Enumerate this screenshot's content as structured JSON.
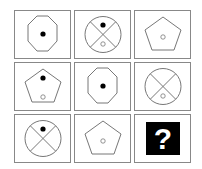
{
  "puzzle": {
    "type": "3x3 matrix reasoning",
    "cells": [
      {
        "row": 1,
        "col": 1,
        "shape": "octagon",
        "dots": [
          {
            "pos": "center",
            "fill": "black"
          }
        ]
      },
      {
        "row": 1,
        "col": 2,
        "shape": "circle-with-x",
        "dots": [
          {
            "pos": "top",
            "fill": "black"
          },
          {
            "pos": "bottom",
            "fill": "white"
          }
        ]
      },
      {
        "row": 1,
        "col": 3,
        "shape": "pentagon",
        "dots": [
          {
            "pos": "center",
            "fill": "white"
          }
        ]
      },
      {
        "row": 2,
        "col": 1,
        "shape": "pentagon",
        "dots": [
          {
            "pos": "top",
            "fill": "black"
          },
          {
            "pos": "bottom",
            "fill": "white"
          }
        ]
      },
      {
        "row": 2,
        "col": 2,
        "shape": "octagon",
        "dots": [
          {
            "pos": "center",
            "fill": "black"
          }
        ]
      },
      {
        "row": 2,
        "col": 3,
        "shape": "circle-with-x",
        "dots": [
          {
            "pos": "bottom",
            "fill": "white"
          }
        ]
      },
      {
        "row": 3,
        "col": 1,
        "shape": "circle-with-x",
        "dots": [
          {
            "pos": "top",
            "fill": "black"
          }
        ]
      },
      {
        "row": 3,
        "col": 2,
        "shape": "pentagon",
        "dots": [
          {
            "pos": "center",
            "fill": "white"
          }
        ]
      },
      {
        "row": 3,
        "col": 3,
        "shape": "unknown",
        "label": "?"
      }
    ],
    "colors": {
      "stroke": "#777777",
      "dot_black": "#000000",
      "question_bg": "#000000",
      "question_fg": "#ffffff"
    }
  }
}
